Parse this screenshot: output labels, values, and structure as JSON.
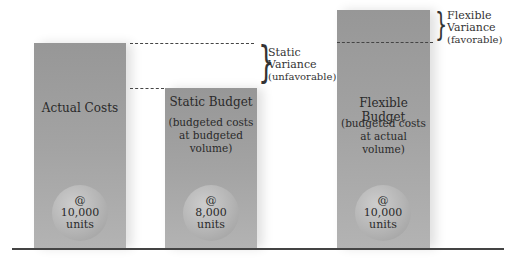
{
  "bars": [
    {
      "title": "Actual Costs",
      "subtitle": "",
      "circle": {
        "at": "@",
        "qty": "10,000",
        "unit": "units"
      }
    },
    {
      "title": "Static Budget",
      "subtitle": "(budgeted costs\nat budgeted\nvolume)",
      "circle": {
        "at": "@",
        "qty": "8,000",
        "unit": "units"
      }
    },
    {
      "title": "Flexible Budget",
      "subtitle": "(budgeted costs\nat actual\nvolume)",
      "circle": {
        "at": "@",
        "qty": "10,000",
        "unit": "units"
      }
    }
  ],
  "variances": {
    "static": {
      "line1": "Static",
      "line2": "Variance",
      "line3": "(unfavorable)"
    },
    "flexible": {
      "line1": "Flexible",
      "line2": "Variance",
      "line3": "(favorable)"
    }
  },
  "colors": {
    "bar": "#a3a3a3",
    "circle": "#b4b4b4",
    "line": "#444444"
  }
}
